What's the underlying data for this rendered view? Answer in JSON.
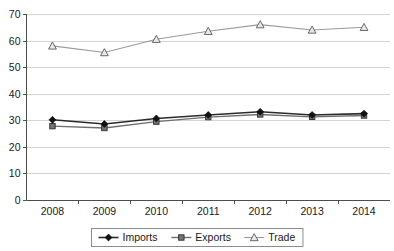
{
  "chart_data": {
    "type": "line",
    "title": "",
    "subtitle": "",
    "xlabel": "",
    "ylabel": "",
    "categories": [
      "2008",
      "2009",
      "2010",
      "2011",
      "2012",
      "2013",
      "2014"
    ],
    "series": [
      {
        "name": "Imports",
        "marker": "diamond",
        "color": "#111111",
        "values": [
          30.2,
          28.6,
          30.7,
          32.0,
          33.2,
          32.0,
          32.5
        ]
      },
      {
        "name": "Exports",
        "marker": "square",
        "color": "#757575",
        "values": [
          27.8,
          27.1,
          29.5,
          31.2,
          32.2,
          31.3,
          31.8
        ]
      },
      {
        "name": "Trade",
        "marker": "triangle",
        "color": "#9a9a9a",
        "values": [
          58.0,
          55.5,
          60.5,
          63.5,
          66.0,
          64.0,
          65.0
        ]
      }
    ],
    "ylim": [
      0,
      70
    ],
    "ytick_step": 10,
    "yticks": [
      "0",
      "10",
      "20",
      "30",
      "40",
      "50",
      "60",
      "70"
    ],
    "grid": true,
    "grid_axis": "y",
    "legend_position": "bottom",
    "legend_entries": [
      "Imports",
      "Exports",
      "Trade"
    ]
  },
  "colors": {
    "gridline": "#c9c9c9",
    "axis": "#4d4d4d",
    "text": "#1a1a1a",
    "background": "#ffffff",
    "legend_border": "#808080"
  }
}
